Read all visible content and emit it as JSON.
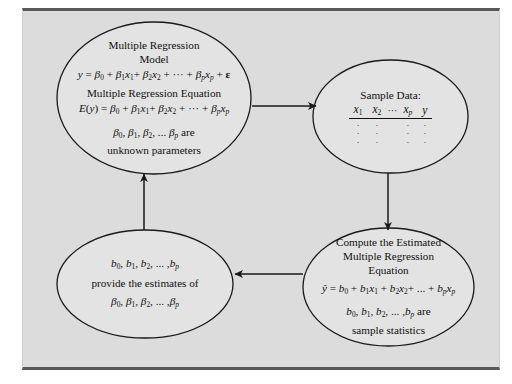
{
  "figure": {
    "background_color": "#dcdcdc",
    "frame_border_color": "#58585a",
    "line_color": "#1a1a1a"
  },
  "nodes": {
    "model": {
      "name": "multiple-regression-model",
      "lines": [
        "Multiple Regression",
        "Model",
        "y = β0 + β1x1 + β2x2 + ··· + βpxp + ϵ",
        "Multiple Regression Equation",
        "E(y) = β0 + β1x1 + β2x2 + ··· + βpxp",
        "β0, β1, β2, ... βp are",
        "unknown parameters"
      ],
      "title_line_1": "Multiple Regression",
      "title_line_2": "Model",
      "subtitle": "Multiple Regression Equation",
      "closing_line": "unknown parameters"
    },
    "sample": {
      "name": "sample-data",
      "title": "Sample Data:",
      "columns": [
        "x1",
        "x2",
        "···",
        "xp",
        "y"
      ],
      "rows": [
        [
          ".",
          ".",
          ".",
          "."
        ],
        [
          ".",
          ".",
          ".",
          "."
        ],
        [
          ".",
          ".",
          ".",
          "."
        ]
      ]
    },
    "compute": {
      "name": "compute-estimated-equation",
      "title_line_1": "Compute the Estimated",
      "title_line_2": "Multiple Regression",
      "title_line_3": "Equation",
      "equation": "ŷ = b0 + b1x1 + b2x2 + ... + bpxp",
      "statistics_line": "b0, b1, b2, ... ,bp are",
      "closing_line": "sample statistics"
    },
    "estimates": {
      "name": "estimates-of-parameters",
      "line_1": "b0, b1, b2, ... ,bp",
      "line_2": "provide the estimates of",
      "line_3": "β0, β1, β2, ... ,βp"
    }
  },
  "arrows": [
    {
      "name": "arrow-model-to-sample",
      "direction": "right",
      "from": "model",
      "to": "sample"
    },
    {
      "name": "arrow-sample-to-compute",
      "direction": "down",
      "from": "sample",
      "to": "compute"
    },
    {
      "name": "arrow-compute-to-estimates",
      "direction": "left",
      "from": "compute",
      "to": "estimates"
    },
    {
      "name": "arrow-estimates-to-model",
      "direction": "up",
      "from": "estimates",
      "to": "model"
    }
  ]
}
